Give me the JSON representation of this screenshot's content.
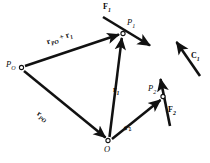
{
  "figure": {
    "width": 210,
    "height": 163,
    "background": "#ffffff",
    "stroke_color": "#111111"
  },
  "points": [
    {
      "id": "P_O",
      "label": "P",
      "sub": "O",
      "x": 21,
      "y": 67,
      "label_x": 6,
      "label_y": 60
    },
    {
      "id": "P_1",
      "label": "P",
      "sub": "1",
      "x": 123,
      "y": 33,
      "label_x": 127,
      "label_y": 19
    },
    {
      "id": "O",
      "label": "O",
      "sub": "",
      "x": 108,
      "y": 141,
      "label_x": 104,
      "label_y": 146
    },
    {
      "id": "P_2",
      "label": "P",
      "sub": "2",
      "x": 163,
      "y": 97,
      "label_x": 148,
      "label_y": 84
    }
  ],
  "vectors": [
    {
      "id": "r_PO_plus_r1",
      "label_main": "r",
      "label_sub": "PO",
      "label_op": " + ",
      "label_main2": "r",
      "label_sub2": "1",
      "from": "P_O",
      "to": "P_1",
      "x1": 25,
      "y1": 66,
      "x2": 120,
      "y2": 34,
      "label_x": 48,
      "label_y": 47
    },
    {
      "id": "r_PO",
      "label_main": "r",
      "label_sub": "PO",
      "from": "P_O",
      "to": "O",
      "x1": 24,
      "y1": 71,
      "x2": 106,
      "y2": 138,
      "label_x": 35,
      "label_y": 114
    },
    {
      "id": "r_1",
      "label_main": "r",
      "label_sub": "1",
      "from": "O",
      "to": "P_1",
      "x1": 109,
      "y1": 137,
      "x2": 122,
      "y2": 37,
      "label_x": 112,
      "label_y": 90
    },
    {
      "id": "r_2",
      "label_main": "r",
      "label_sub": "2",
      "from": "O",
      "to": "P_2",
      "x1": 112,
      "y1": 139,
      "x2": 161,
      "y2": 100,
      "label_x": 127,
      "label_y": 128
    }
  ],
  "forces": [
    {
      "id": "F_1",
      "label_main": "F",
      "label_sub": "1",
      "applied_at": "P_1",
      "x1": 103,
      "y1": 17,
      "x2": 151,
      "y2": 46,
      "label_x": 103,
      "label_y": 4
    },
    {
      "id": "F_2",
      "label_main": "F",
      "label_sub": "2",
      "applied_at": "P_2",
      "x1": 170,
      "y1": 126,
      "x2": 160,
      "y2": 78,
      "label_x": 168,
      "label_y": 108
    }
  ],
  "couples": [
    {
      "id": "C_1",
      "label_main": "C",
      "label_sub": "1",
      "x1": 200,
      "y1": 76,
      "x2": 176,
      "y2": 41,
      "label_x": 191,
      "label_y": 56
    }
  ]
}
